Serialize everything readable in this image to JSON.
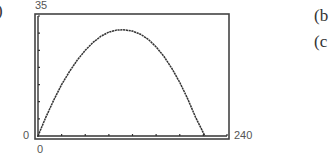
{
  "figure": {
    "part_label_left": ")",
    "part_labels_right": [
      "(b",
      "(c"
    ]
  },
  "window": {
    "ymax_label": "35",
    "ymin_label": "0",
    "xmin_label": "0",
    "xmax_label": "240"
  },
  "chart_data": {
    "type": "line",
    "title": "",
    "xlabel": "",
    "ylabel": "",
    "xlim": [
      0,
      240
    ],
    "ylim": [
      0,
      35
    ],
    "x_tick_step": 30,
    "y_tick_step": 5,
    "grid": false,
    "legend": null,
    "tick_labels": {
      "x": [
        "0",
        "240"
      ],
      "y": [
        "0",
        "35"
      ]
    },
    "series": [
      {
        "name": "parabolic path",
        "x": [
          0,
          10,
          20,
          30,
          40,
          50,
          60,
          70,
          80,
          90,
          100,
          108,
          120,
          130,
          140,
          150,
          160,
          170,
          180,
          190,
          200,
          212
        ],
        "y": [
          0,
          5.5,
          10.5,
          15,
          18.8,
          22.2,
          25,
          27.3,
          29.1,
          30.3,
          30.9,
          31,
          30.6,
          29.7,
          28.2,
          26,
          23.2,
          19.7,
          15.6,
          10.9,
          5.5,
          0
        ]
      }
    ]
  }
}
